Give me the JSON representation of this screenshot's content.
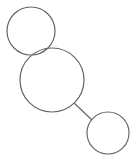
{
  "diagram": {
    "stroke_color": "#666666",
    "background": "#ffffff",
    "nodes": [
      {
        "id": "node-top",
        "cx": 31,
        "cy": 31,
        "r": 24
      },
      {
        "id": "node-middle",
        "cx": 52,
        "cy": 80,
        "r": 32
      },
      {
        "id": "node-bottom",
        "cx": 108,
        "cy": 133,
        "r": 21
      }
    ],
    "edges": [
      {
        "from": "node-middle",
        "to": "node-bottom",
        "x1": 74,
        "y1": 103,
        "x2": 92,
        "y2": 120
      }
    ]
  }
}
